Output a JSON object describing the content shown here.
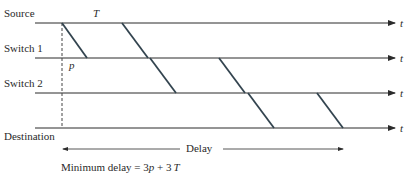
{
  "diagram": {
    "rows": [
      {
        "label": "Source",
        "y": 23
      },
      {
        "label": "Switch 1",
        "y": 58
      },
      {
        "label": "Switch 2",
        "y": 93
      },
      {
        "label": "Destination",
        "y": 128
      }
    ],
    "axis_label": "t",
    "T_label": "T",
    "p_label": "p",
    "delay_label": "Delay",
    "formula_prefix": "Minimum delay = 3",
    "formula_p": "p",
    "formula_mid": " + 3",
    "formula_T": "T",
    "line_color": "#2b2b2b",
    "packet_color": "#3a4a55"
  }
}
